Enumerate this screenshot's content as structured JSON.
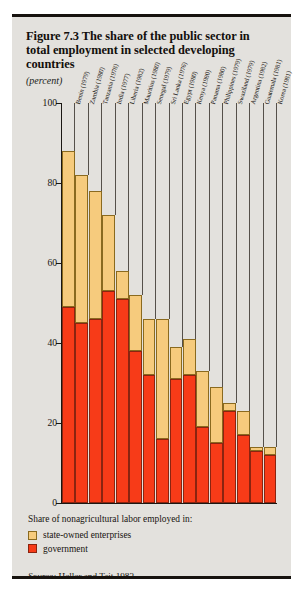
{
  "figure": {
    "title": "Figure 7.3  The share of the public sector in total employment in selected developing countries",
    "subtitle": "(percent)",
    "source_prefix": "Source:",
    "source_text": " Heller and Tait 1983."
  },
  "legend": {
    "title": "Share of nonagricultural labor employed in:",
    "items": [
      {
        "label": "state-owned enterprises",
        "color": "#f6cb7d"
      },
      {
        "label": "government",
        "color": "#f73b18"
      }
    ]
  },
  "chart_data": {
    "type": "bar",
    "subtype": "stacked-vertical",
    "title": "Figure 7.3  The share of the public sector in total employment in selected developing countries",
    "subtitle": "(percent)",
    "xlabel": "",
    "ylabel": "percent",
    "ylim": [
      0,
      100
    ],
    "yticks": [
      0,
      20,
      40,
      60,
      80,
      100
    ],
    "grid": false,
    "legend_position": "below-plot",
    "categories": [
      "Benin (1979)",
      "Zambia (1980)",
      "Tanzania (1978)",
      "India (1977)",
      "Liberia (1982)",
      "Mauritius (1980)",
      "Senegal (1979)",
      "Sri Lanka (1976)",
      "Egypt (1980)",
      "Kenya (1980)",
      "Panama (1980)",
      "Philippines (1979)",
      "Swaziland (1979)",
      "Argentina (1982)",
      "Guatemala (1981)",
      "Korea (1981)"
    ],
    "series": [
      {
        "name": "government",
        "color": "#f73b18",
        "values": [
          49,
          45,
          46,
          53,
          51,
          38,
          32,
          16,
          31,
          32,
          19,
          15,
          23,
          17,
          13,
          12
        ]
      },
      {
        "name": "state-owned enterprises",
        "color": "#f6cb7d",
        "values": [
          39,
          37,
          32,
          19,
          7,
          14,
          14,
          30,
          8,
          9,
          14,
          14,
          2,
          6,
          1,
          2
        ]
      }
    ],
    "totals": [
      88,
      82,
      78,
      72,
      58,
      52,
      46,
      46,
      39,
      41,
      33,
      29,
      25,
      23,
      14,
      14
    ]
  }
}
